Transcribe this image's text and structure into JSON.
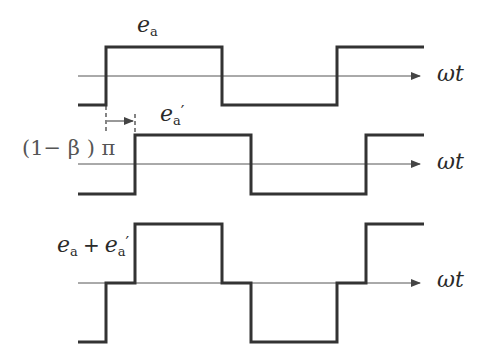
{
  "diagram": {
    "type": "waveform",
    "colors": {
      "wave": "#333333",
      "axis": "#444444",
      "text": "#2a2a2a",
      "background": "#ffffff"
    },
    "axis_label": "ωt",
    "waveforms": [
      {
        "label": {
          "base": "e",
          "sub": "a",
          "prime": ""
        },
        "axis_y": 76,
        "high_y": 47,
        "low_y": 105,
        "points": [
          [
            78,
            105
          ],
          [
            106,
            105
          ],
          [
            106,
            47
          ],
          [
            222,
            47
          ],
          [
            222,
            105
          ],
          [
            337,
            105
          ],
          [
            337,
            47
          ],
          [
            424,
            47
          ]
        ]
      },
      {
        "label": {
          "base": "e",
          "sub": "a",
          "prime": "′"
        },
        "axis_y": 164,
        "high_y": 135,
        "low_y": 194,
        "points": [
          [
            78,
            194
          ],
          [
            135,
            194
          ],
          [
            135,
            135
          ],
          [
            251,
            135
          ],
          [
            251,
            194
          ],
          [
            366,
            194
          ],
          [
            366,
            135
          ],
          [
            424,
            135
          ]
        ]
      },
      {
        "label": {
          "base": "e",
          "sub": "a",
          "plus": "+",
          "base2": "e",
          "sub2": "a",
          "prime": "′"
        },
        "axis_y": 283,
        "high_y": 224,
        "low_y": 342,
        "points": [
          [
            78,
            342
          ],
          [
            106,
            342
          ],
          [
            106,
            283
          ],
          [
            135,
            283
          ],
          [
            135,
            224
          ],
          [
            222,
            224
          ],
          [
            222,
            283
          ],
          [
            251,
            283
          ],
          [
            251,
            342
          ],
          [
            337,
            342
          ],
          [
            337,
            283
          ],
          [
            366,
            283
          ],
          [
            366,
            224
          ],
          [
            424,
            224
          ]
        ]
      }
    ],
    "phase_shift": {
      "label": "(1− β ) π",
      "from_x": 106,
      "to_x": 135,
      "arrow_y": 121
    }
  }
}
